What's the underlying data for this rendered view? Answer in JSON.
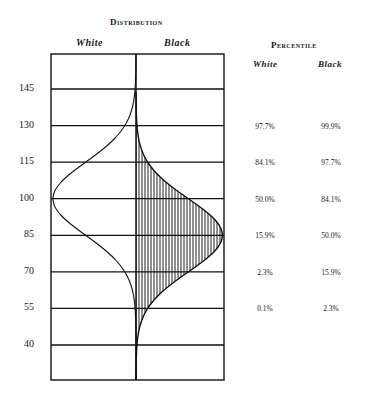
{
  "chart_data": {
    "type": "area",
    "title": "Distribution",
    "subtitle": "Percentile",
    "distribution_columns": [
      "White",
      "Black"
    ],
    "percentile_columns": [
      "White",
      "Black"
    ],
    "ylabel": "",
    "xlabel": "",
    "y_ticks": [
      145,
      130,
      115,
      100,
      85,
      70,
      55,
      40
    ],
    "ylim": [
      25,
      160
    ],
    "grid": true,
    "series": [
      {
        "name": "White",
        "mean": 100,
        "sd": 15,
        "fill": "none",
        "direction": "left"
      },
      {
        "name": "Black",
        "mean": 85,
        "sd": 15,
        "fill": "vertical-hatch",
        "direction": "right"
      }
    ],
    "percentiles": [
      {
        "score": 130,
        "white": "97.7%",
        "black": "99.9%"
      },
      {
        "score": 115,
        "white": "84.1%",
        "black": "97.7%"
      },
      {
        "score": 100,
        "white": "50.0%",
        "black": "84.1%"
      },
      {
        "score": 85,
        "white": "15.9%",
        "black": "50.0%"
      },
      {
        "score": 70,
        "white": "2.3%",
        "black": "15.9%"
      },
      {
        "score": 55,
        "white": "0.1%",
        "black": "2.3%"
      }
    ]
  },
  "labels": {
    "distribution": "Distribution",
    "percentile": "Percentile",
    "white": "White",
    "black": "Black"
  }
}
